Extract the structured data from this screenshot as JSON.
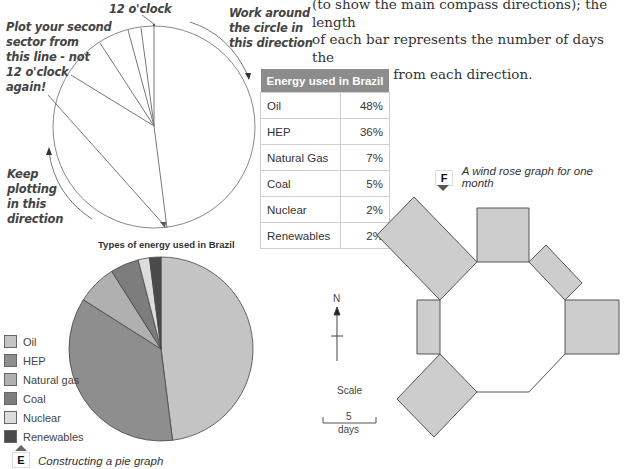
{
  "intro_text": {
    "lines": [
      "(to show the main compass directions); the length",
      "of each bar represents the number of days the",
      "wind blows from each direction."
    ]
  },
  "construction_diagram": {
    "label_12_oclock": "12 o'clock",
    "label_second_sector": [
      "Plot your second",
      "sector from",
      "this line - not",
      "12 o'clock",
      "again!"
    ],
    "label_work_around": [
      "Work around",
      "the circle in",
      "this direction"
    ],
    "label_keep_plotting": [
      "Keep",
      "plotting",
      "in this",
      "direction"
    ]
  },
  "energy_table": {
    "header": "Energy used in Brazil",
    "rows": [
      {
        "source": "Oil",
        "percent": "48%"
      },
      {
        "source": "HEP",
        "percent": "36%"
      },
      {
        "source": "Natural Gas",
        "percent": "7%"
      },
      {
        "source": "Coal",
        "percent": "5%"
      },
      {
        "source": "Nuclear",
        "percent": "2%"
      },
      {
        "source": "Renewables",
        "percent": "2%"
      }
    ]
  },
  "figure_e": {
    "badge": "E",
    "caption": "Constructing a pie graph"
  },
  "figure_f": {
    "badge": "F",
    "caption": "A wind rose graph for one month"
  },
  "chart_data": [
    {
      "type": "pie",
      "title": "Types of energy used in Brazil",
      "categories": [
        "Oil",
        "HEP",
        "Natural gas",
        "Coal",
        "Nuclear",
        "Renewables"
      ],
      "values": [
        48,
        36,
        7,
        5,
        2,
        2
      ],
      "colors": [
        "#c4c4c4",
        "#8e8e8e",
        "#b0b0b0",
        "#7d7d7d",
        "#dcdcdc",
        "#4a4a4a"
      ],
      "start_angle": "12 o'clock",
      "direction": "clockwise",
      "legend_position": "left"
    },
    {
      "type": "wind_rose",
      "title": "A wind rose graph for one month",
      "directions": [
        "N",
        "NE",
        "E",
        "SE",
        "S",
        "SW",
        "W",
        "NW"
      ],
      "values_days": [
        5.5,
        3,
        5,
        0,
        0,
        5,
        2.5,
        7.5
      ],
      "scale_label": "Scale",
      "scale_value": "5",
      "scale_unit": "days",
      "north_label": "N"
    }
  ]
}
